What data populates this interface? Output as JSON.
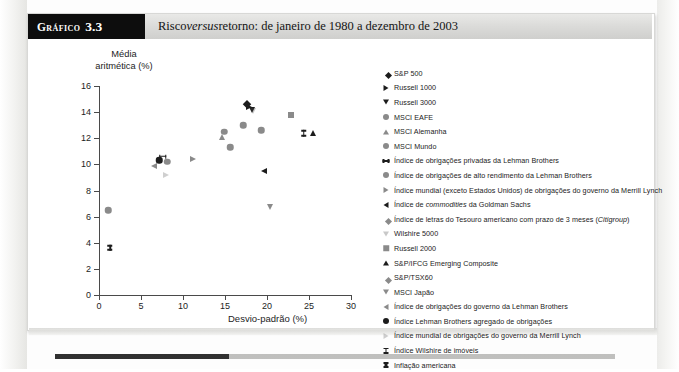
{
  "header": {
    "tag_word": "Gráfico",
    "tag_number": "3.3",
    "title_pre": "Risco ",
    "title_em": "versus",
    "title_post": " retorno: de janeiro de 1980 a dezembro de 2003"
  },
  "chart_data": {
    "type": "scatter",
    "title": "Risco versus retorno: de janeiro de 1980 a dezembro de 2003",
    "ylabel_line1": "Média",
    "ylabel_line2": "aritmética (%)",
    "xlabel": "Desvio-padrão (%)",
    "xlim": [
      0,
      30
    ],
    "ylim": [
      0,
      16
    ],
    "xticks": [
      "0",
      "5",
      "10",
      "15",
      "20",
      "25",
      "30"
    ],
    "yticks": [
      "0",
      "2",
      "4",
      "6",
      "8",
      "10",
      "12",
      "14",
      "16"
    ],
    "grid": false,
    "legend_position": "right",
    "points": [
      {
        "name": "S&P 500",
        "x": 17.6,
        "y": 14.6,
        "marker": "diamond",
        "color": "#1c1c1c"
      },
      {
        "name": "Russell 1000",
        "x": 17.9,
        "y": 14.4,
        "marker": "triangle-right",
        "color": "#1c1c1c"
      },
      {
        "name": "Russell 3000",
        "x": 18.2,
        "y": 14.2,
        "marker": "triangle-down",
        "color": "#1c1c1c"
      },
      {
        "name": "MSCI EAFE",
        "x": 17.2,
        "y": 13.0,
        "marker": "circle",
        "color": "#8a8a8a"
      },
      {
        "name": "MSCI Alemanha",
        "x": 22.9,
        "y": 13.8,
        "marker": "square",
        "color": "#8a8a8a"
      },
      {
        "name": "MSCI Mundo",
        "x": 19.3,
        "y": 12.6,
        "marker": "circle",
        "color": "#8a8a8a"
      },
      {
        "name": "Índice de obrigações privadas da Lehman Brothers",
        "x": 7.6,
        "y": 10.6,
        "marker": "h-bar",
        "color": "#1c1c1c"
      },
      {
        "name": "Índice de obrigações de alto rendimento da Lehman Brothers",
        "x": 8.1,
        "y": 10.2,
        "marker": "circle",
        "color": "#8a8a8a"
      },
      {
        "name": "Índice mundial (exceto Estados Unidos) de obrigações do governo da Merrill Lynch",
        "x": 11.2,
        "y": 10.4,
        "marker": "triangle-right",
        "color": "#8a8a8a"
      },
      {
        "name": "Índice de commodities da Goldman Sachs",
        "x": 19.7,
        "y": 9.5,
        "marker": "triangle-left",
        "color": "#1c1c1c"
      },
      {
        "name": "Índice de letras do Tesouro americano com prazo de 3 meses (Citigroup)",
        "x": 1.1,
        "y": 6.5,
        "marker": "circle",
        "color": "#8a8a8a"
      },
      {
        "name": "Wilshire 5000",
        "x": 18.3,
        "y": 14.1,
        "marker": "triangle-down-open",
        "color": "#4a4a4a"
      },
      {
        "name": "Russell 2000",
        "x": 20.4,
        "y": 6.7,
        "marker": "triangle-down",
        "color": "#8a8a8a"
      },
      {
        "name": "S&P/IFCG Emerging Composite",
        "x": 25.5,
        "y": 12.4,
        "marker": "triangle-up",
        "color": "#1c1c1c"
      },
      {
        "name": "S&P/TSX60",
        "x": 15.6,
        "y": 11.3,
        "marker": "circle",
        "color": "#8a8a8a"
      },
      {
        "name": "MSCI Japão",
        "x": 14.9,
        "y": 12.5,
        "marker": "circle",
        "color": "#8a8a8a"
      },
      {
        "name": "Índice de obrigações do governo da Lehman Brothers",
        "x": 6.6,
        "y": 9.9,
        "marker": "triangle-left",
        "color": "#8a8a8a"
      },
      {
        "name": "Índice Lehman Brothers agregado de obrigações",
        "x": 7.2,
        "y": 10.3,
        "marker": "circle",
        "color": "#1c1c1c"
      },
      {
        "name": "Índice mundial de obrigações do governo da Merrill Lynch",
        "x": 8.0,
        "y": 9.2,
        "marker": "triangle-right-open",
        "color": "#6a6a6a"
      },
      {
        "name": "Índice Wilshire de imóveis",
        "x": 24.4,
        "y": 12.4,
        "marker": "i-bar",
        "color": "#1c1c1c"
      },
      {
        "name": "Inflação americana",
        "x": 1.3,
        "y": 3.6,
        "marker": "i-bar-bold",
        "color": "#1c1c1c"
      },
      {
        "name": "MSCI Alemanha",
        "x": 14.6,
        "y": 12.1,
        "marker": "triangle-up",
        "color": "#8a8a8a"
      }
    ],
    "legend": [
      {
        "label": "S&P 500",
        "marker": "diamond",
        "color": "#1c1c1c"
      },
      {
        "label": "Russell 1000",
        "marker": "triangle-right",
        "color": "#1c1c1c"
      },
      {
        "label": "Russell 3000",
        "marker": "triangle-down",
        "color": "#1c1c1c"
      },
      {
        "label": "MSCI EAFE",
        "marker": "circle",
        "color": "#8a8a8a"
      },
      {
        "label": "MSCI Alemanha",
        "marker": "triangle-up",
        "color": "#8a8a8a"
      },
      {
        "label": "MSCI Mundo",
        "marker": "circle",
        "color": "#8a8a8a"
      },
      {
        "label": "Índice de obrigações privadas da Lehman Brothers",
        "marker": "h-bar",
        "color": "#1c1c1c"
      },
      {
        "label": "Índice de obrigações de alto rendimento da Lehman Brothers",
        "marker": "circle",
        "color": "#8a8a8a"
      },
      {
        "label": "Índice mundial (exceto Estados Unidos) de obrigações do governo da Merrill Lynch",
        "marker": "triangle-right",
        "color": "#8a8a8a"
      },
      {
        "label": "Índice de commodities da Goldman Sachs",
        "marker": "triangle-left",
        "color": "#1c1c1c",
        "em": "commodities"
      },
      {
        "label": "Índice de letras do Tesouro americano com prazo de 3 meses (Citigroup)",
        "marker": "diamond",
        "color": "#8a8a8a",
        "em": "Citigroup"
      },
      {
        "label": "Wilshire 5000",
        "marker": "triangle-down-open",
        "color": "#4a4a4a"
      },
      {
        "label": "Russell 2000",
        "marker": "square",
        "color": "#8a8a8a"
      },
      {
        "label": "S&P/IFCG Emerging Composite",
        "marker": "triangle-up",
        "color": "#1c1c1c"
      },
      {
        "label": "S&P/TSX60",
        "marker": "diamond",
        "color": "#8a8a8a"
      },
      {
        "label": "MSCI Japão",
        "marker": "triangle-down",
        "color": "#8a8a8a"
      },
      {
        "label": "Índice de obrigações do governo da Lehman Brothers",
        "marker": "triangle-left",
        "color": "#8a8a8a"
      },
      {
        "label": "Índice Lehman Brothers agregado de obrigações",
        "marker": "circle",
        "color": "#1c1c1c"
      },
      {
        "label": "Índice mundial de obrigações do governo da Merrill Lynch",
        "marker": "triangle-right-open",
        "color": "#6a6a6a"
      },
      {
        "label": "Índice Wilshire de imóveis",
        "marker": "i-bar",
        "color": "#1c1c1c"
      },
      {
        "label": "Inflação americana",
        "marker": "i-bar-bold",
        "color": "#1c1c1c"
      }
    ]
  }
}
